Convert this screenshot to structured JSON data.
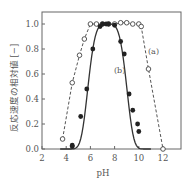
{
  "chart_data": {
    "type": "scatter",
    "title": "",
    "xlabel": "pH",
    "ylabel": "反応速度の相対値 [−]",
    "xlim": [
      2,
      13.5
    ],
    "ylim": [
      0,
      1.1
    ],
    "x_ticks": [
      "2",
      "4",
      "6",
      "8",
      "10",
      "12"
    ],
    "y_ticks": [
      "0.0",
      "0.2",
      "0.4",
      "0.6",
      "0.8",
      "1.0"
    ],
    "grid": false,
    "series": [
      {
        "name": "(a)",
        "marker": "open-circle",
        "line": "dashed",
        "x": [
          3.7,
          4.5,
          5.1,
          5.5,
          6.0,
          6.5,
          7.0,
          7.5,
          8.0,
          8.5,
          9.0,
          9.5,
          10.0,
          10.2,
          10.8,
          12.0
        ],
        "y": [
          0.08,
          0.53,
          0.75,
          0.88,
          1.0,
          1.0,
          1.0,
          1.0,
          1.0,
          1.01,
          1.01,
          1.0,
          1.0,
          0.98,
          0.64,
          0.0
        ]
      },
      {
        "name": "(b)",
        "marker": "filled-circle",
        "line": "solid-fit",
        "x": [
          4.5,
          4.5,
          5.2,
          5.7,
          6.2,
          6.8,
          7.0,
          7.3,
          7.5,
          8.0,
          8.5,
          8.8,
          9.2,
          9.5,
          9.9,
          10.0
        ],
        "y": [
          0.03,
          0.02,
          0.26,
          0.48,
          0.8,
          0.98,
          1.0,
          1.0,
          1.0,
          0.99,
          0.86,
          0.76,
          0.44,
          0.31,
          0.2,
          0.14
        ]
      }
    ],
    "annotations": [
      "(a)",
      "(b)"
    ]
  },
  "labels": {
    "a": "(a)",
    "b": "(b)",
    "xlabel": "pH",
    "ylabel": "反応速度の相対値 [−]",
    "caption": "酵素……による……な曲線と……曲線と……"
  }
}
